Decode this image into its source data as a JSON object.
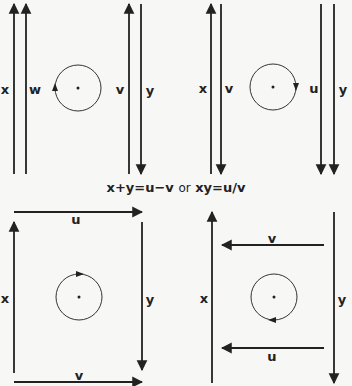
{
  "diagrams": [
    {
      "id": "top-left",
      "labels": {
        "left_outer": "x",
        "left_inner": "w",
        "right_inner": "v",
        "right_outer": "y"
      },
      "rotation": "counter-clockwise"
    },
    {
      "id": "top-right",
      "labels": {
        "left_outer": "x",
        "left_inner": "v",
        "right_inner": "u",
        "right_outer": "y"
      },
      "rotation": "clockwise"
    },
    {
      "id": "bottom-left",
      "labels": {
        "left": "x",
        "top": "u",
        "right": "y",
        "bottom": "v"
      },
      "rotation": "clockwise"
    },
    {
      "id": "bottom-right",
      "labels": {
        "left": "x",
        "top": "v",
        "right": "y",
        "bottom": "u"
      },
      "rotation": "counter-clockwise"
    }
  ],
  "caption": {
    "eq1": "x+y=u−v",
    "or": "or",
    "eq2": "xy=u/v"
  },
  "colors": {
    "ink": "#222222",
    "background": "#f7f7f5"
  }
}
